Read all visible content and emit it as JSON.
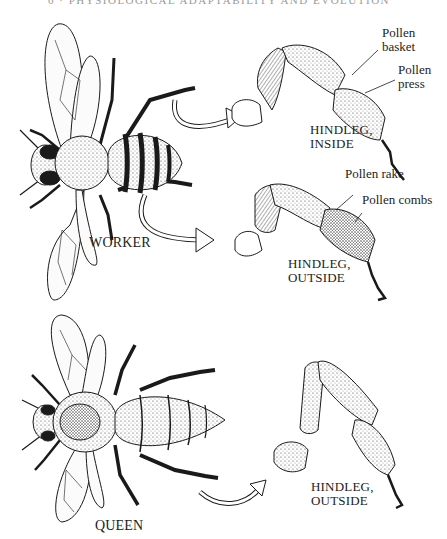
{
  "header": {
    "running_title": "6 · PHYSIOLOGICAL ADAPTABILITY AND EVOLUTION"
  },
  "figure": {
    "worker": {
      "caption": "WORKER",
      "inside_leg": {
        "title_line1": "HINDLEG,",
        "title_line2": "INSIDE",
        "callouts": [
          {
            "line1": "Pollen",
            "line2": "basket"
          },
          {
            "line1": "Pollen",
            "line2": "press"
          }
        ]
      },
      "outside_leg": {
        "title_line1": "HINDLEG,",
        "title_line2": "OUTSIDE",
        "callouts": [
          {
            "text": "Pollen rake"
          },
          {
            "text": "Pollen combs"
          }
        ]
      }
    },
    "queen": {
      "caption": "QUEEN",
      "outside_leg": {
        "title_line1": "HINDLEG,",
        "title_line2": "OUTSIDE"
      }
    }
  },
  "colors": {
    "ink": "#1a1a1a",
    "paper": "#ffffff",
    "header_gray": "#9a9a9a"
  }
}
